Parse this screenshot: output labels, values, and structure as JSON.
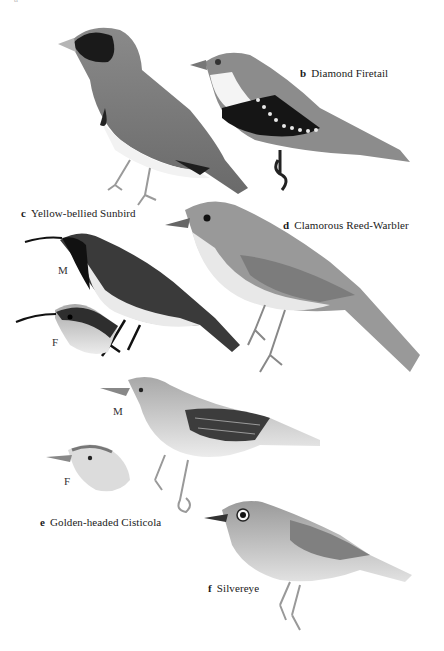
{
  "page": {
    "type": "field guide plate",
    "cropped_top_label": "a"
  },
  "species": [
    {
      "letter": "a",
      "name": "",
      "note": "label cropped at top edge"
    },
    {
      "letter": "b",
      "name": "Diamond Firetail"
    },
    {
      "letter": "c",
      "name": "Yellow-bellied Sunbird",
      "sexes": [
        "M",
        "F"
      ]
    },
    {
      "letter": "d",
      "name": "Clamorous Reed-Warbler"
    },
    {
      "letter": "e",
      "name": "Golden-headed Cisticola",
      "sexes": [
        "M",
        "F"
      ]
    },
    {
      "letter": "f",
      "name": "Silvereye"
    }
  ],
  "colors": {
    "background": "#ffffff",
    "text": "#1a1a1a",
    "dark": "#1c1c1c",
    "mid": "#7a7a7a",
    "light": "#b9b9b9",
    "pale": "#e6e6e6"
  }
}
